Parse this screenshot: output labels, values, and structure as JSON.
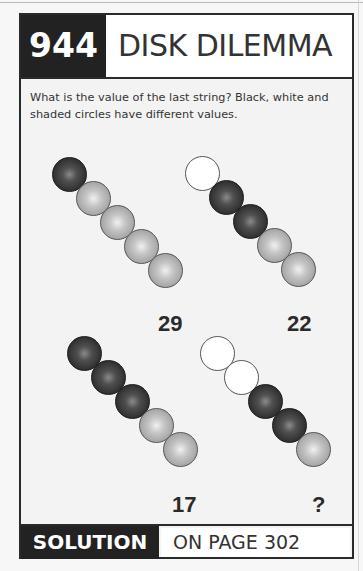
{
  "puzzle": {
    "number": "944",
    "title": "DISK DILEMMA",
    "description": "What is the value of the last string? Black, white and shaded circles have different values."
  },
  "colors": {
    "black_circle": "#2e2e2e",
    "shaded_circle": "#a8a8a8",
    "white_circle": "#ffffff",
    "title_box": "#222222"
  },
  "strings": [
    {
      "circles": [
        "black",
        "shaded",
        "shaded",
        "shaded",
        "shaded"
      ],
      "value": "29"
    },
    {
      "circles": [
        "white",
        "black",
        "black",
        "shaded",
        "shaded"
      ],
      "value": "22"
    },
    {
      "circles": [
        "black",
        "black",
        "black",
        "shaded",
        "shaded"
      ],
      "value": "17"
    },
    {
      "circles": [
        "white",
        "white",
        "black",
        "black",
        "shaded"
      ],
      "value": "?"
    }
  ],
  "footer": {
    "solution_label": "SOLUTION",
    "page_ref": "ON PAGE 302"
  }
}
